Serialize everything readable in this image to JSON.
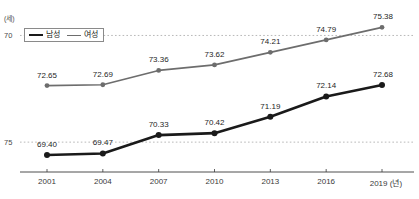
{
  "title_fragment": "",
  "axis": {
    "unit_label": "(세)",
    "x_unit_label": "(년)",
    "yticks": [
      "75",
      "70"
    ]
  },
  "legend": {
    "male_label": "남성",
    "female_label": "여성",
    "male_color": "#1a1a1a",
    "female_color": "#6d6d6d"
  },
  "source_note": "",
  "chart_data": {
    "type": "line",
    "title": "",
    "xlabel": "(년)",
    "ylabel": "(세)",
    "ylim": [
      68.6,
      76.1
    ],
    "yticks": [
      70,
      75
    ],
    "grid": true,
    "legend_position": "top-left",
    "categories": [
      "2001",
      "2004",
      "2007",
      "2010",
      "2013",
      "2016",
      "2019"
    ],
    "series": [
      {
        "name": "남성",
        "color": "#1a1a1a",
        "values": [
          69.4,
          69.47,
          70.33,
          70.42,
          71.19,
          72.14,
          72.68
        ],
        "labels": [
          "69.40",
          "69.47",
          "70.33",
          "70.42",
          "71.19",
          "72.14",
          "72.68"
        ]
      },
      {
        "name": "여성",
        "color": "#6d6d6d",
        "values": [
          72.65,
          72.69,
          73.36,
          73.62,
          74.21,
          74.79,
          75.38
        ],
        "labels": [
          "72.65",
          "72.69",
          "73.36",
          "73.62",
          "74.21",
          "74.79",
          "75.38"
        ]
      }
    ]
  }
}
